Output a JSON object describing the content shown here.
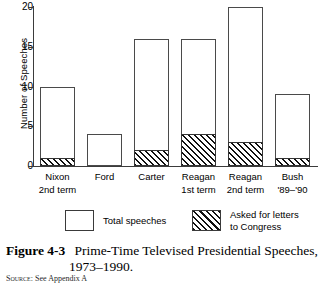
{
  "chart_data": {
    "type": "bar",
    "title": "",
    "xlabel": "",
    "ylabel": "Number of Speeches",
    "ylim": [
      0,
      20
    ],
    "yticks": [
      0,
      5,
      10,
      15,
      20
    ],
    "grid": false,
    "stacked": true,
    "legend_position": "below-axes",
    "categories": [
      "Nixon 2nd term",
      "Ford",
      "Carter",
      "Reagan 1st term",
      "Reagan 2nd term",
      "Bush '89–'90"
    ],
    "category_lines": [
      {
        "line1": "Nixon",
        "line2": "2nd term"
      },
      {
        "line1": "Ford",
        "line2": ""
      },
      {
        "line1": "Carter",
        "line2": ""
      },
      {
        "line1": "Reagan",
        "line2": "1st term"
      },
      {
        "line1": "Reagan",
        "line2": "2nd term"
      },
      {
        "line1": "Bush",
        "line2": "'89–'90"
      }
    ],
    "series": [
      {
        "name": "Total speeches",
        "values": [
          10,
          4,
          16,
          16,
          20,
          9
        ]
      },
      {
        "name": "Asked for letters to Congress",
        "values": [
          1,
          0,
          2,
          4,
          3,
          1
        ]
      }
    ],
    "legend": [
      {
        "label": "Total speeches",
        "label_line2": "",
        "pattern": "open"
      },
      {
        "label": "Asked for letters",
        "label_line2": "to Congress",
        "pattern": "hatched"
      }
    ]
  },
  "caption": {
    "label": "Figure 4-3",
    "line1": "Prime-Time Televised Presidential Speeches,",
    "line2": "1973–1990."
  },
  "source": {
    "label": "Source:",
    "text": "See Appendix A"
  }
}
